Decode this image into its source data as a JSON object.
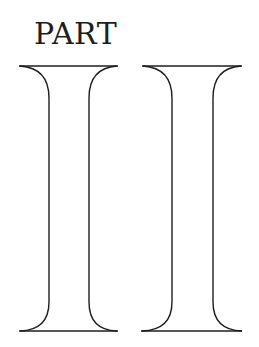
{
  "page": {
    "heading": "PART",
    "numeral": "II",
    "numeral_glyphs": [
      {
        "name": "roman-numeral-i-first",
        "char": "I"
      },
      {
        "name": "roman-numeral-i-second",
        "char": "I"
      }
    ],
    "colors": {
      "background": "#ffffff",
      "ink": "#1e1e1e"
    }
  }
}
